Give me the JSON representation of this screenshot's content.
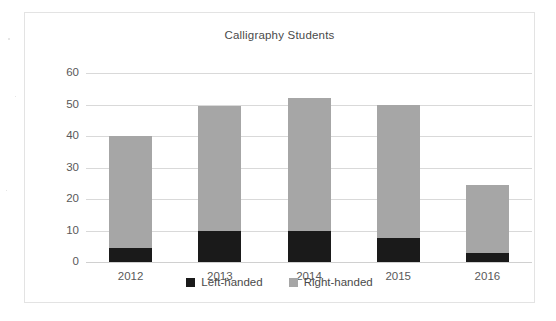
{
  "chart_data": {
    "type": "bar",
    "subtype": "stacked-vertical",
    "title": "Calligraphy Students",
    "xlabel": "",
    "ylabel": "",
    "categories": [
      "2012",
      "2013",
      "2014",
      "2015",
      "2016"
    ],
    "series": [
      {
        "name": "Left-handed",
        "color": "#1a1a1a",
        "values": [
          4.5,
          10,
          10,
          7.5,
          3
        ]
      },
      {
        "name": "Right-handed",
        "color": "#a6a6a6",
        "values": [
          35.5,
          39.5,
          42,
          42.5,
          21.5
        ]
      }
    ],
    "totals": [
      40,
      49.5,
      52,
      50,
      24.5
    ],
    "ylim": [
      0,
      60
    ],
    "yticks": [
      0,
      10,
      20,
      30,
      40,
      50,
      60
    ],
    "ytick_labels": [
      "0",
      "10",
      "20",
      "30",
      "40",
      "50",
      "60"
    ],
    "grid": true,
    "grid_axis": "y",
    "legend_position": "bottom",
    "legend": [
      "Left-handed",
      "Right-handed"
    ],
    "plot_background": "#ffffff",
    "grid_color": "#d9d9d9",
    "frame_color": "#e3e3e3",
    "text_color": "#595959"
  }
}
